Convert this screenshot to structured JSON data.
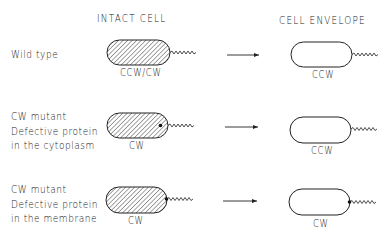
{
  "headers": {
    "intact_cell": "INTACT CELL",
    "cell_envelope": "CELL ENVELOPE"
  },
  "rows": [
    {
      "label_lines": [
        "Wild type"
      ],
      "intact_label": "CCW/CW",
      "envelope_label": "CCW",
      "intact_defect_dot": "none",
      "envelope_defect_dot": "none"
    },
    {
      "label_lines": [
        "CW mutant",
        "Defective protein",
        "in the cytoplasm"
      ],
      "intact_label": "CW",
      "envelope_label": "CCW",
      "intact_defect_dot": "cytoplasm",
      "envelope_defect_dot": "none"
    },
    {
      "label_lines": [
        "CW mutant",
        "Defective protein",
        "in the membrane"
      ],
      "intact_label": "CW",
      "envelope_label": "CW",
      "intact_defect_dot": "membrane",
      "envelope_defect_dot": "membrane"
    }
  ],
  "colors": {
    "ink": "#222222",
    "background": "#ffffff"
  }
}
